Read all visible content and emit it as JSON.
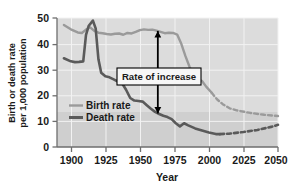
{
  "chart_data": {
    "type": "line",
    "title": "",
    "xlabel": "Year",
    "ylabel_line1": "Birth or death rate",
    "ylabel_line2": "per 1,000 population",
    "xlim": [
      1890,
      2050
    ],
    "ylim": [
      0,
      50
    ],
    "xticks": [
      1900,
      1925,
      1950,
      1975,
      2000,
      2025,
      2050
    ],
    "xtick_labels": [
      "1900",
      "1925",
      "1950",
      "1975",
      "2000",
      "2025",
      "2050"
    ],
    "yticks": [
      0,
      10,
      20,
      30,
      40,
      50
    ],
    "ytick_labels": [
      "0",
      "10",
      "20",
      "30",
      "40",
      "50"
    ],
    "grid": true,
    "legend_position": "inside-left-lower",
    "annotations": [
      {
        "name": "rate-of-increase",
        "text": "Rate of increase",
        "arrow": "double-headed-vertical",
        "x_year": 1963,
        "y_top": 45,
        "y_bottom": 13
      }
    ],
    "series": [
      {
        "name": "Birth rate",
        "color": "#9a9a9a",
        "style": "solid-then-dashed",
        "dash_starts_year": 2002,
        "x": [
          1895,
          1900,
          1905,
          1908,
          1911,
          1914,
          1917,
          1920,
          1923,
          1926,
          1929,
          1932,
          1935,
          1938,
          1941,
          1944,
          1947,
          1950,
          1953,
          1956,
          1959,
          1962,
          1965,
          1968,
          1971,
          1974,
          1977,
          1980,
          1983,
          1986,
          1989,
          1992,
          1995,
          1998,
          2002,
          2006,
          2010,
          2015,
          2020,
          2030,
          2040,
          2050
        ],
        "y": [
          47.3,
          45.6,
          44.4,
          44.2,
          45.5,
          46.4,
          45.0,
          44.3,
          44.1,
          43.8,
          43.6,
          43.9,
          44.0,
          43.5,
          44.2,
          44.0,
          44.6,
          45.3,
          45.6,
          45.4,
          45.5,
          45.1,
          44.6,
          44.1,
          44.3,
          44.2,
          43.6,
          40.0,
          35.2,
          31.0,
          28.0,
          26.4,
          25.6,
          23.4,
          21.0,
          18.4,
          16.6,
          15.0,
          14.2,
          13.2,
          12.5,
          12.0
        ]
      },
      {
        "name": "Death rate",
        "color": "#5a5a5a",
        "style": "solid-then-dashed",
        "dash_starts_year": 2008,
        "x": [
          1895,
          1900,
          1903,
          1906,
          1909,
          1911,
          1913,
          1916,
          1918,
          1920,
          1922,
          1925,
          1928,
          1931,
          1934,
          1937,
          1940,
          1943,
          1946,
          1949,
          1952,
          1955,
          1958,
          1961,
          1964,
          1967,
          1970,
          1973,
          1976,
          1979,
          1982,
          1985,
          1990,
          1995,
          2000,
          2005,
          2008,
          2015,
          2025,
          2035,
          2045,
          2050
        ],
        "y": [
          34.4,
          33.2,
          32.9,
          33.0,
          33.2,
          43.5,
          47.0,
          49.0,
          46.0,
          34.0,
          28.8,
          27.4,
          27.0,
          26.2,
          25.4,
          24.8,
          22.2,
          19.0,
          18.0,
          17.8,
          17.6,
          16.2,
          14.8,
          13.6,
          12.8,
          12.1,
          11.6,
          10.8,
          9.2,
          8.0,
          9.2,
          8.4,
          7.2,
          6.4,
          5.6,
          5.0,
          5.0,
          5.2,
          5.8,
          6.6,
          7.8,
          8.6
        ]
      }
    ]
  },
  "legend": {
    "items": [
      {
        "label": "Birth rate",
        "color": "#9a9a9a"
      },
      {
        "label": "Death rate",
        "color": "#5a5a5a"
      }
    ]
  },
  "axes": {
    "x_title": "Year",
    "y_title_line1": "Birth or death rate",
    "y_title_line2": "per 1,000 population"
  }
}
